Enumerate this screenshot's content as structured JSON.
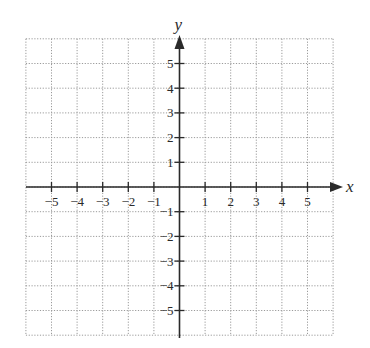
{
  "chart_data": {
    "type": "scatter",
    "title": "",
    "subtitle": "",
    "xlabel": "x",
    "ylabel": "y",
    "xlim": [
      -6,
      6
    ],
    "ylim": [
      -6,
      6
    ],
    "grid": true,
    "grid_style": "dotted",
    "legend": null,
    "x_ticks": [
      -5,
      -4,
      -3,
      -2,
      -1,
      1,
      2,
      3,
      4,
      5
    ],
    "y_ticks": [
      -5,
      -4,
      -3,
      -2,
      -1,
      1,
      2,
      3,
      4,
      5
    ],
    "x_tick_labels": [
      "−5",
      "−4",
      "−3",
      "−2",
      "−1",
      "1",
      "2",
      "3",
      "4",
      "5"
    ],
    "y_tick_labels": [
      "−5",
      "−4",
      "−3",
      "−2",
      "−1",
      "1",
      "2",
      "3",
      "4",
      "5"
    ],
    "series": [],
    "annotations": []
  },
  "axes": {
    "x_label": "x",
    "y_label": "y"
  },
  "colors": {
    "axis": "#2a2a2a",
    "grid": "#9a9a9a",
    "background": "#ffffff"
  }
}
